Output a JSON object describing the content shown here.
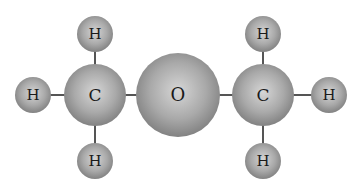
{
  "diagram": {
    "title": "",
    "molecule_labels": {
      "hydrogen": "H",
      "carbon": "C",
      "oxygen": "O"
    },
    "atoms": [
      {
        "id": "h1",
        "element": "H",
        "label": "H",
        "x": 33,
        "y": 95
      },
      {
        "id": "c1",
        "element": "C",
        "label": "C",
        "x": 95,
        "y": 95
      },
      {
        "id": "h2",
        "element": "H",
        "label": "H",
        "x": 95,
        "y": 34
      },
      {
        "id": "h3",
        "element": "H",
        "label": "H",
        "x": 95,
        "y": 161
      },
      {
        "id": "o1",
        "element": "O",
        "label": "O",
        "x": 178,
        "y": 95
      },
      {
        "id": "c2",
        "element": "C",
        "label": "C",
        "x": 263,
        "y": 95
      },
      {
        "id": "h4",
        "element": "H",
        "label": "H",
        "x": 263,
        "y": 34
      },
      {
        "id": "h5",
        "element": "H",
        "label": "H",
        "x": 263,
        "y": 161
      },
      {
        "id": "h6",
        "element": "H",
        "label": "H",
        "x": 329,
        "y": 95
      }
    ],
    "bonds": [
      [
        "h1",
        "c1"
      ],
      [
        "c1",
        "h2"
      ],
      [
        "c1",
        "h3"
      ],
      [
        "c1",
        "o1"
      ],
      [
        "o1",
        "c2"
      ],
      [
        "c2",
        "h4"
      ],
      [
        "c2",
        "h5"
      ],
      [
        "c2",
        "h6"
      ]
    ],
    "colors": {
      "background": "#ffffff",
      "bond": "#555555",
      "atom_fill": "#a9a9a9",
      "label": "#1a1a1a"
    }
  }
}
